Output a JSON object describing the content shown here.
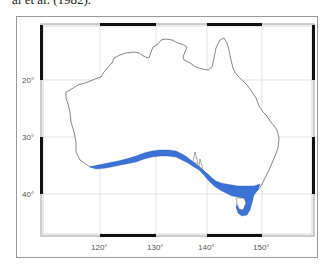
{
  "caption": "al et al. (1982).",
  "map": {
    "region": "Australia",
    "projection_frame": "boxed with alternating black/white tick bars",
    "latitude_labels": [
      "20°",
      "30°",
      "40°"
    ],
    "longitude_labels": [
      "120°",
      "130°",
      "140°",
      "150°"
    ],
    "colors": {
      "land_fill": "#ffffff",
      "coastline": "#555555",
      "highlight_band": "#3b72d6",
      "gridline": "#d0d0d0",
      "frame_bar": "#111111"
    },
    "highlight_description": "Blue band along southern coastline from southwest WA through SA, Victoria and around Tasmania"
  }
}
